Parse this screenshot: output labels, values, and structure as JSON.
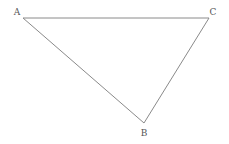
{
  "diagram": {
    "type": "triangle",
    "stroke_color": "#8a8a8a",
    "vertices": [
      {
        "label": "A",
        "x": 23,
        "y": 18,
        "label_x": 17,
        "label_y": 15
      },
      {
        "label": "C",
        "x": 209,
        "y": 18,
        "label_x": 213,
        "label_y": 15
      },
      {
        "label": "B",
        "x": 144,
        "y": 123,
        "label_x": 144,
        "label_y": 136
      }
    ]
  }
}
